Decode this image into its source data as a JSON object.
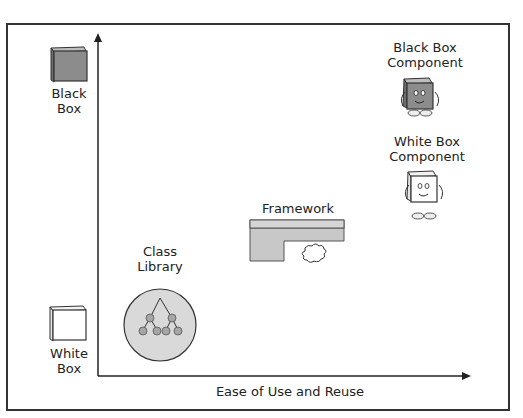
{
  "diagram": {
    "y_axis": {
      "top_label": "Black Box",
      "top_label_lines": [
        "Black",
        "Box"
      ],
      "bottom_label_lines": [
        "White",
        "Box"
      ],
      "top_icon": "black-box-cube-icon",
      "bottom_icon": "white-box-cube-icon"
    },
    "x_axis": {
      "label": "Ease of Use and Reuse"
    },
    "items": [
      {
        "id": "class-library",
        "label_lines": [
          "Class",
          "Library"
        ],
        "icon": "class-hierarchy-tree-icon"
      },
      {
        "id": "framework",
        "label_lines": [
          "Framework"
        ],
        "icon": "framework-block-with-puzzle-piece-icon"
      },
      {
        "id": "black-box-component",
        "label_lines": [
          "Black Box",
          "Component"
        ],
        "icon": "black-box-character-icon"
      },
      {
        "id": "white-box-component",
        "label_lines": [
          "White Box",
          "Component"
        ],
        "icon": "white-box-character-icon"
      }
    ],
    "colors": {
      "frame": "#333333",
      "black_box_fill": "#8c8c8c",
      "framework_fill": "#c8c8c8",
      "library_circle": "#d9d9d9",
      "node": "#a6a6a6"
    }
  }
}
